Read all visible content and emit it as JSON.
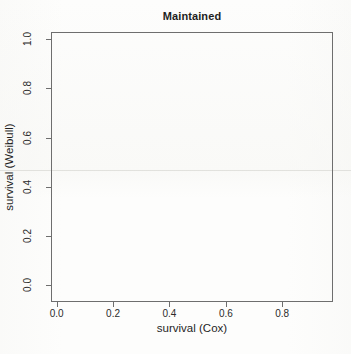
{
  "chart_data": {
    "type": "scatter",
    "title": "Maintained",
    "subtitle": "",
    "xlabel": "survival (Cox)",
    "ylabel": "survival (Weibull)",
    "xlim": [
      -0.02,
      0.98
    ],
    "ylim": [
      -0.07,
      1.03
    ],
    "xticks": [
      "0.0",
      "0.2",
      "0.4",
      "0.6",
      "0.8"
    ],
    "xtick_values": [
      0.0,
      0.2,
      0.4,
      0.6,
      0.8
    ],
    "yticks": [
      "0.0",
      "0.2",
      "0.4",
      "0.6",
      "0.8",
      "1.0"
    ],
    "ytick_values": [
      0.0,
      0.2,
      0.4,
      0.6,
      0.8,
      1.0
    ],
    "grid": false,
    "legend": null,
    "legend_position": "none",
    "box": true,
    "series": [
      {
        "name": "Maintained",
        "x": [],
        "y": []
      }
    ],
    "annotations": []
  },
  "figure": {
    "title": "Maintained",
    "axis_x_title": "survival (Cox)",
    "axis_y_title": "survival (Weibull)",
    "background_color": "#fdfdfc",
    "axis_color": "#6e6e6e",
    "text_color": "#1f1f1f"
  }
}
